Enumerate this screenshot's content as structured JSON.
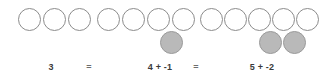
{
  "diagram": {
    "canvas": {
      "width": 323,
      "height": 80,
      "background": "#ffffff"
    },
    "colors": {
      "positive_fill": "#ffffff",
      "positive_stroke": "#8c8c8c",
      "negative_fill": "#b9b9b9",
      "negative_stroke": "#9a9a9a",
      "text": "#3a3a3a",
      "operator_text": "#6e6e6e"
    },
    "counter_size": 23,
    "groups": [
      {
        "id": "group-1",
        "label": "3",
        "label_x": 51,
        "label_y": 62,
        "positive_count": 3,
        "negative_count": 0,
        "value": 3,
        "positives": [
          {
            "x": 18,
            "y": 8
          },
          {
            "x": 43,
            "y": 8
          },
          {
            "x": 68,
            "y": 8
          }
        ],
        "negatives": []
      },
      {
        "id": "group-2",
        "label": "4 + -1",
        "label_x": 160,
        "label_y": 62,
        "positive_count": 4,
        "negative_count": 1,
        "value": 3,
        "positives": [
          {
            "x": 97,
            "y": 8
          },
          {
            "x": 122,
            "y": 8
          },
          {
            "x": 147,
            "y": 8
          },
          {
            "x": 172,
            "y": 8
          }
        ],
        "negatives": [
          {
            "x": 160,
            "y": 31
          }
        ]
      },
      {
        "id": "group-3",
        "label": "5 + -2",
        "label_x": 262,
        "label_y": 62,
        "positive_count": 5,
        "negative_count": 2,
        "value": 3,
        "positives": [
          {
            "x": 200,
            "y": 8
          },
          {
            "x": 224,
            "y": 8
          },
          {
            "x": 248,
            "y": 8
          },
          {
            "x": 272,
            "y": 8
          },
          {
            "x": 296,
            "y": 8
          }
        ],
        "negatives": [
          {
            "x": 259,
            "y": 31
          },
          {
            "x": 283,
            "y": 31
          }
        ]
      }
    ],
    "operators": [
      {
        "id": "equals-1",
        "symbol": "=",
        "x": 89,
        "y": 62
      },
      {
        "id": "equals-2",
        "symbol": "=",
        "x": 196,
        "y": 62
      }
    ]
  }
}
